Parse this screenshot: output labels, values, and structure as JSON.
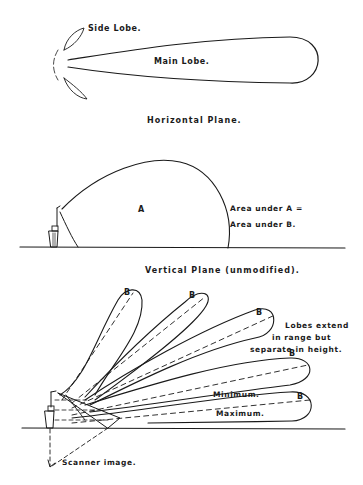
{
  "horizontal_plane": {
    "side_lobe_label": "Side Lobe.",
    "main_lobe_label": "Main Lobe.",
    "caption": "Horizontal Plane."
  },
  "vertical_unmodified": {
    "area_label": "A",
    "note_line1": "Area under A =",
    "note_line2": "Area under B.",
    "caption": "Vertical Plane (unmodified)."
  },
  "vertical_modified": {
    "lobe_labels": [
      "B",
      "B",
      "B",
      "B",
      "B"
    ],
    "note_line1": "Lobes extend",
    "note_line2": "in range but",
    "note_line3": "separate in height.",
    "minimum_label": "Minimum.",
    "maximum_label": "Maximum.",
    "scanner_label": "Scanner image."
  },
  "colors": {
    "ink": "#1a1a1a",
    "paper": "#ffffff"
  }
}
